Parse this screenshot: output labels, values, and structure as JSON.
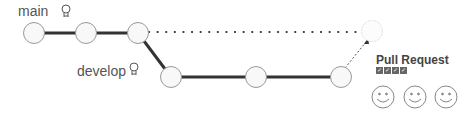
{
  "branches": {
    "main": {
      "label": "main",
      "icon": "lightbulb-icon"
    },
    "develop": {
      "label": "develop",
      "icon": "lightbulb-icon"
    }
  },
  "pull_request": {
    "title": "Pull Request",
    "checks": [
      "✓",
      "✓",
      "✓",
      "✓"
    ],
    "reviewers": [
      "smiley-face",
      "smiley-face",
      "smiley-face"
    ]
  },
  "colors": {
    "line": "#333333",
    "circle_stroke": "#999999",
    "circle_fill": "#f8f8f8",
    "ghost_stroke": "#dddddd",
    "check_bg": "#666666"
  }
}
